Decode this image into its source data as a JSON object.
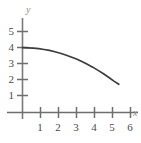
{
  "chart_data": {
    "type": "line",
    "title": "",
    "subtitle": "",
    "xlabel": "x",
    "ylabel": "y",
    "xlim": [
      0,
      6.6
    ],
    "ylim": [
      0,
      5.6
    ],
    "x_ticks": [
      1,
      2,
      3,
      4,
      5,
      6
    ],
    "x_tick_labels": [
      "1",
      "2",
      "3",
      "4",
      "5",
      "6"
    ],
    "y_ticks": [
      1,
      2,
      3,
      4,
      5
    ],
    "y_tick_labels": [
      "1",
      "2",
      "3",
      "4",
      "5"
    ],
    "grid": false,
    "legend": null,
    "annotations": [],
    "series": [
      {
        "name": "curve",
        "style": "solid",
        "color": "#3c3c3c",
        "x": [
          0.0,
          0.3,
          0.6,
          0.9,
          1.2,
          1.5,
          1.8,
          2.1,
          2.4,
          2.7,
          3.0,
          3.3,
          3.6,
          3.9,
          4.2,
          4.5,
          4.8,
          5.1,
          5.35
        ],
        "y": [
          4.0,
          3.99,
          3.97,
          3.94,
          3.89,
          3.83,
          3.75,
          3.66,
          3.55,
          3.43,
          3.3,
          3.15,
          2.98,
          2.8,
          2.6,
          2.39,
          2.16,
          1.92,
          1.74
        ]
      }
    ]
  },
  "axes": {
    "x_axis_name": "x",
    "y_axis_name": "y",
    "axis_color": "#6e6e6e",
    "tick_color": "#4a4a4a",
    "curve_color": "#3c3c3c",
    "background": "#ffffff"
  }
}
